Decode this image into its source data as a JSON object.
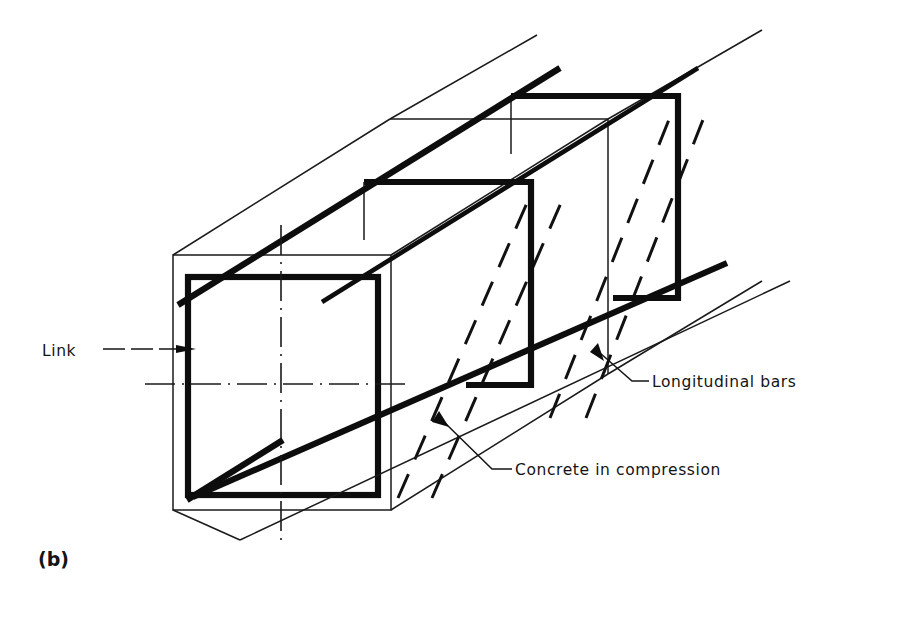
{
  "figure": {
    "caption": "(b)"
  },
  "labels": {
    "link": "Link",
    "longitudinal_bars": "Longitudinal  bars",
    "concrete_in_compression": "Concrete  in  compression"
  },
  "colors": {
    "ink": "#141414",
    "background": "#ffffff"
  },
  "legend_elements": [
    {
      "name": "link",
      "style": "thick solid rectangle",
      "text": "Link"
    },
    {
      "name": "longitudinal-bars",
      "style": "thick solid inclined lines",
      "text": "Longitudinal  bars"
    },
    {
      "name": "concrete-in-compression",
      "style": "dashed inclined struts",
      "text": "Concrete  in  compression"
    }
  ]
}
